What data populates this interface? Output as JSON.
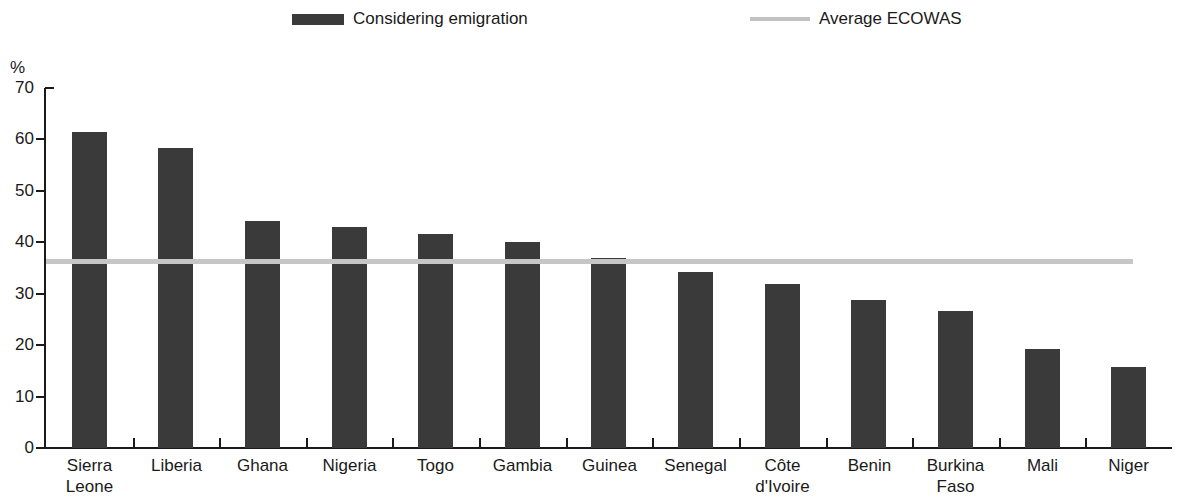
{
  "legend": {
    "entries": [
      {
        "label": "Considering emigration",
        "type": "bar",
        "color": "#3a3a3a"
      },
      {
        "label": "Average ECOWAS",
        "type": "line",
        "color": "#c6c6c6"
      }
    ]
  },
  "axis": {
    "y_unit": "%",
    "y_ticks": [
      "70",
      "60",
      "50",
      "40",
      "30",
      "20",
      "10",
      "0"
    ]
  },
  "chart_data": {
    "type": "bar",
    "title": "",
    "subtitle": "",
    "xlabel": "",
    "ylabel": "%",
    "ylim": [
      0,
      70
    ],
    "ytick_values": [
      0,
      10,
      20,
      30,
      40,
      50,
      60,
      70
    ],
    "grid": false,
    "legend_position": "top",
    "categories": [
      "Sierra Leone",
      "Liberia",
      "Ghana",
      "Nigeria",
      "Togo",
      "Gambia",
      "Guinea",
      "Senegal",
      "Côte d'Ivoire",
      "Benin",
      "Burkina Faso",
      "Mali",
      "Niger"
    ],
    "category_lines": [
      [
        "Sierra",
        "Leone"
      ],
      [
        "Liberia"
      ],
      [
        "Ghana"
      ],
      [
        "Nigeria"
      ],
      [
        "Togo"
      ],
      [
        "Gambia"
      ],
      [
        "Guinea"
      ],
      [
        "Senegal"
      ],
      [
        "Côte",
        "d'Ivoire"
      ],
      [
        "Benin"
      ],
      [
        "Burkina",
        "Faso"
      ],
      [
        "Mali"
      ],
      [
        "Niger"
      ]
    ],
    "series": [
      {
        "name": "Considering emigration",
        "color": "#3a3a3a",
        "values": [
          61.5,
          58.3,
          44.2,
          43.0,
          41.6,
          40.1,
          37.0,
          34.3,
          31.8,
          28.7,
          26.7,
          19.2,
          15.7
        ]
      }
    ],
    "reference_line": {
      "name": "Average ECOWAS",
      "value": 36.3,
      "color": "#c6c6c6"
    }
  }
}
